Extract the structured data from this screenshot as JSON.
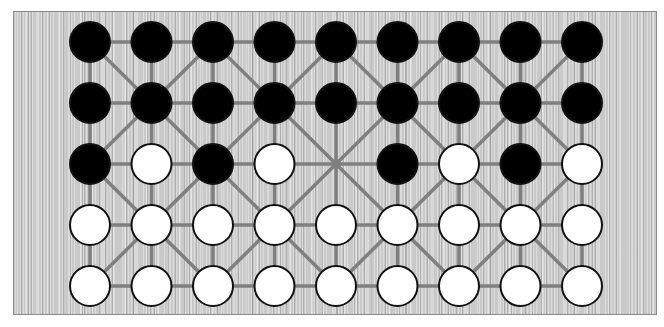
{
  "game": {
    "name": "Fanorona",
    "board": {
      "columns": 9,
      "rows": 5,
      "colors": {
        "wood": "#c9c9c9",
        "line": "#7f7f7f",
        "black_stone": "#000000",
        "white_stone": "#ffffff",
        "stone_outline": "#111111"
      }
    },
    "position": [
      [
        "B",
        "B",
        "B",
        "B",
        "B",
        "B",
        "B",
        "B",
        "B"
      ],
      [
        "B",
        "B",
        "B",
        "B",
        "B",
        "B",
        "B",
        "B",
        "B"
      ],
      [
        "B",
        "W",
        "B",
        "W",
        "",
        "B",
        "W",
        "B",
        "W"
      ],
      [
        "W",
        "W",
        "W",
        "W",
        "W",
        "W",
        "W",
        "W",
        "W"
      ],
      [
        "W",
        "W",
        "W",
        "W",
        "W",
        "W",
        "W",
        "W",
        "W"
      ]
    ],
    "counts": {
      "black": 22,
      "white": 22
    }
  }
}
